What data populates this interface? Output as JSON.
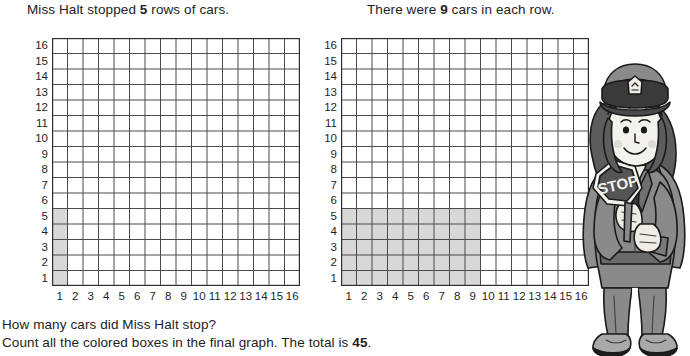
{
  "worksheet": {
    "prompt_left": {
      "before": "Miss Halt stopped ",
      "number": "5",
      "after": " rows of cars."
    },
    "prompt_right": {
      "before": "There were ",
      "number": "9",
      "after": " cars in each row."
    },
    "question": "How many cars did Miss Halt stop?",
    "total_line": {
      "before": "Count all the colored boxes in the final graph. The total is ",
      "number": "45",
      "after": "."
    }
  },
  "chart_data": {
    "type": "heatmap",
    "title": "",
    "charts": [
      {
        "name": "left-graph",
        "caption": "Miss Halt stopped 5 rows of cars.",
        "columns": 16,
        "rows": 16,
        "xlabel": "",
        "ylabel": "",
        "x_ticks": [
          "1",
          "2",
          "3",
          "4",
          "5",
          "6",
          "7",
          "8",
          "9",
          "10",
          "11",
          "12",
          "13",
          "14",
          "15",
          "16"
        ],
        "y_ticks": [
          "1",
          "2",
          "3",
          "4",
          "5",
          "6",
          "7",
          "8",
          "9",
          "10",
          "11",
          "12",
          "13",
          "14",
          "15",
          "16"
        ],
        "shaded_columns": 1,
        "shaded_rows": 5,
        "shaded_count": 5,
        "shaded_color": "#d8d8d8",
        "grid": true
      },
      {
        "name": "right-graph",
        "caption": "There were 9 cars in each row.",
        "columns": 16,
        "rows": 16,
        "xlabel": "",
        "ylabel": "",
        "x_ticks": [
          "1",
          "2",
          "3",
          "4",
          "5",
          "6",
          "7",
          "8",
          "9",
          "10",
          "11",
          "12",
          "13",
          "14",
          "15",
          "16"
        ],
        "y_ticks": [
          "1",
          "2",
          "3",
          "4",
          "5",
          "6",
          "7",
          "8",
          "9",
          "10",
          "11",
          "12",
          "13",
          "14",
          "15",
          "16"
        ],
        "shaded_columns": 9,
        "shaded_rows": 5,
        "shaded_count": 45,
        "shaded_color": "#d8d8d8",
        "grid": true
      }
    ]
  },
  "illustration": {
    "name": "crossing-guard-with-stop-sign",
    "sign_text": "STOP",
    "colors": {
      "uniform": "#8a8a8a",
      "uniform_dark": "#6d6d6d",
      "hair": "#585858",
      "skin": "#f1efe9",
      "sign": "#555555",
      "outline": "#1a1a1a"
    }
  }
}
